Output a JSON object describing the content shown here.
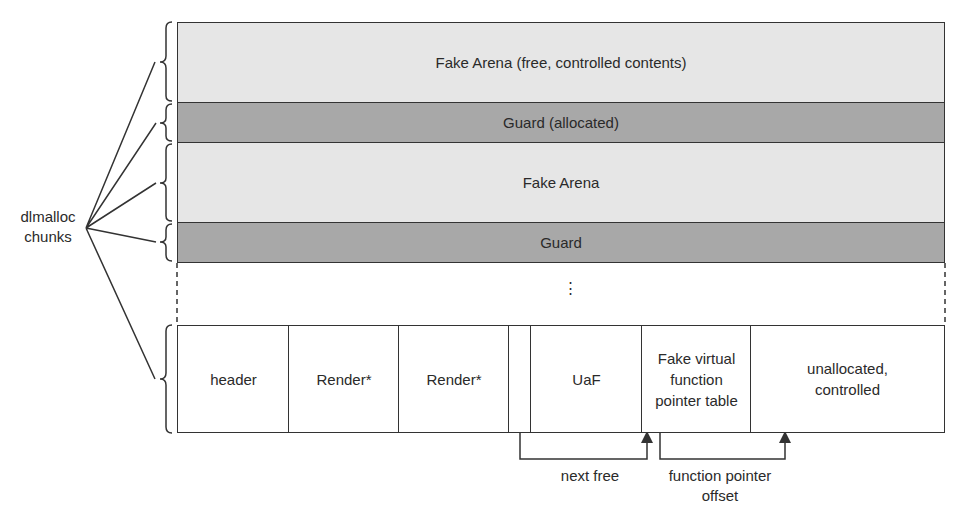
{
  "side_label": {
    "line1": "dlmalloc",
    "line2": "chunks"
  },
  "rows": [
    {
      "label": "Fake Arena (free, controlled contents)",
      "shade": "light"
    },
    {
      "label": "Guard (allocated)",
      "shade": "dark"
    },
    {
      "label": "Fake Arena",
      "shade": "light"
    },
    {
      "label": "Guard",
      "shade": "dark"
    }
  ],
  "ellipsis": "⋮",
  "bottom_cells": [
    {
      "label": "header"
    },
    {
      "label": "Render*"
    },
    {
      "label": "Render*"
    },
    {
      "label": ""
    },
    {
      "label": "UaF"
    },
    {
      "label": "Fake virtual function pointer table"
    },
    {
      "label": "unallocated, controlled"
    }
  ],
  "arrows": [
    {
      "label": "next free"
    },
    {
      "label": "function pointer offset"
    }
  ],
  "colors": {
    "light": "#e6e6e6",
    "dark": "#a8a8a8",
    "line": "#333333"
  }
}
